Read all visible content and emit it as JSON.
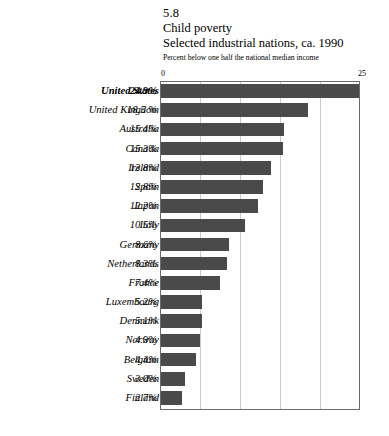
{
  "figure": {
    "number": "5.8",
    "title": "Child poverty",
    "subtitle": "Selected industrial nations, ca. 1990",
    "note": "Percent below one half the national median income"
  },
  "axis": {
    "tick_min_label": "0",
    "tick_max_label": "25"
  },
  "colors": {
    "bar": "#4a4a4a",
    "frame": "#6b6b6b",
    "grid": "#c9c9c9",
    "background": "#ffffff"
  },
  "chart_data": {
    "type": "bar",
    "orientation": "horizontal",
    "title": "Child poverty",
    "subtitle": "Selected industrial nations, ca. 1990",
    "xlabel": "Percent below one half the national median income",
    "ylabel": "",
    "xlim": [
      0,
      25
    ],
    "xticks": [
      0,
      25
    ],
    "xtick_labels": [
      "0",
      "25"
    ],
    "grid": true,
    "gridlines_x": [
      5,
      10,
      15,
      20
    ],
    "legend": "none",
    "highlight_category": "United States",
    "categories": [
      "United States",
      "United Kingdom",
      "Australia",
      "Canada",
      "Ireland",
      "Spain",
      "Japan",
      "Italy",
      "Germany",
      "Netherlands",
      "France",
      "Luxembourg",
      "Denmark",
      "Norway",
      "Belgium",
      "Sweden",
      "Finland"
    ],
    "values": [
      24.9,
      18.5,
      15.4,
      15.3,
      13.8,
      12.8,
      12.2,
      10.5,
      8.6,
      8.3,
      7.4,
      5.2,
      5.1,
      4.9,
      4.4,
      3.0,
      2.7
    ],
    "value_labels": [
      "24.9%",
      "18.5 %",
      "15.4%",
      "15.3%",
      "13.8%",
      "12.8%",
      "12.2%",
      "10.5%",
      "8.6%",
      "8.3%",
      "7.4%",
      "5.2%",
      "5.1%",
      "4.9%",
      "4.4%",
      "3.0%",
      "2.7%"
    ]
  }
}
